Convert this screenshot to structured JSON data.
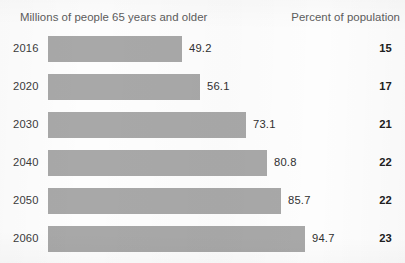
{
  "header": {
    "left_label": "Millions of people 65 years and older",
    "right_label": "Percent of population"
  },
  "colors": {
    "bar_fill": "#a8a8a8",
    "header_text": "#5c5c5c",
    "body_text": "#303030",
    "background": "#fdfdfd"
  },
  "chart_data": {
    "type": "bar",
    "orientation": "horizontal",
    "title": "",
    "subtitle": "",
    "xlabel": "Millions of people 65 years and older",
    "ylabel": "",
    "grid": false,
    "legend": "none",
    "xlim": [
      0,
      94.7
    ],
    "categories": [
      "2016",
      "2020",
      "2030",
      "2040",
      "2050",
      "2060"
    ],
    "values": [
      49.2,
      56.1,
      73.1,
      80.8,
      85.7,
      94.7
    ],
    "value_labels": [
      "49.2",
      "56.1",
      "73.1",
      "80.8",
      "85.7",
      "94.7"
    ],
    "series": [
      {
        "name": "Millions of people 65 years and older",
        "values": [
          49.2,
          56.1,
          73.1,
          80.8,
          85.7,
          94.7
        ]
      },
      {
        "name": "Percent of population",
        "values": [
          15,
          17,
          21,
          22,
          22,
          23
        ]
      }
    ],
    "rows": [
      {
        "year": "2016",
        "millions": "49.2",
        "percent": "15"
      },
      {
        "year": "2020",
        "millions": "56.1",
        "percent": "17"
      },
      {
        "year": "2030",
        "millions": "73.1",
        "percent": "21"
      },
      {
        "year": "2040",
        "millions": "80.8",
        "percent": "22"
      },
      {
        "year": "2050",
        "millions": "85.7",
        "percent": "22"
      },
      {
        "year": "2060",
        "millions": "94.7",
        "percent": "23"
      }
    ]
  }
}
